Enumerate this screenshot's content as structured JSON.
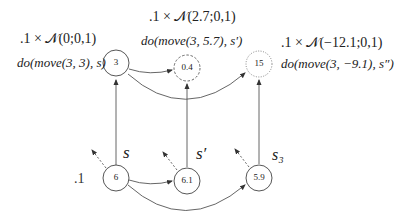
{
  "diagram": {
    "weight_label": ".1",
    "top_nodes": [
      {
        "id": "n3",
        "value": "3",
        "style": "solid"
      },
      {
        "id": "n04",
        "value": "0.4",
        "style": "dashed"
      },
      {
        "id": "n15",
        "value": "15",
        "style": "dotted"
      }
    ],
    "bottom_nodes": [
      {
        "id": "n6",
        "value": "6",
        "state_label": "s"
      },
      {
        "id": "n61",
        "value": "6.1",
        "state_label": "s′"
      },
      {
        "id": "n59",
        "value": "5.9",
        "state_label": "s₃"
      }
    ],
    "annotations": [
      {
        "distribution": ".1 × 𝒩(0;0,1)",
        "action": "do(move(3, 3), s)"
      },
      {
        "distribution": ".1 × 𝒩(2.7;0,1)",
        "action": "do(move(3, 5.7), s′)"
      },
      {
        "distribution": ".1 × 𝒩(−12.1;0,1)",
        "action": "do(move(3, −9.1), s″)"
      }
    ],
    "colors": {
      "stroke": "#555555",
      "text": "#222222",
      "background": "#ffffff"
    }
  }
}
